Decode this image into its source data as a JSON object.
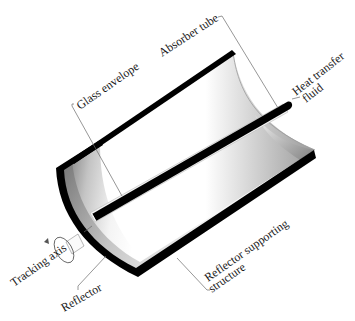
{
  "diagram": {
    "labels": {
      "absorber_tube": "Absorber tube",
      "glass_envelope": "Glass envelope",
      "heat_transfer_fluid_line1": "Heat transfer",
      "heat_transfer_fluid_line2": "fluid",
      "reflector_supporting_line1": "Reflector supporting",
      "reflector_supporting_line2": "structure",
      "tracking_axis": "Tracking axis",
      "reflector": "Reflector"
    },
    "colors": {
      "outline": "#000000",
      "leader": "#6a6a6a",
      "reflector_dark": "#6e6e6e",
      "reflector_light": "#ffffff",
      "background": "#ffffff"
    }
  }
}
